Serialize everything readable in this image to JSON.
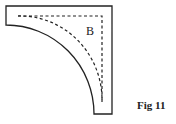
{
  "figure": {
    "piece_label": "B",
    "caption": "Fig 11",
    "colors": {
      "stroke": "#222222",
      "background": "#ffffff"
    }
  }
}
